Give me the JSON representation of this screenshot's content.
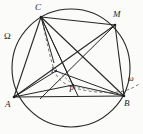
{
  "figure": {
    "canvas": {
      "width": 143,
      "height": 134,
      "background": "#fbfbfa"
    },
    "stroke_color": "#262626",
    "dash_color": "#5a5a5a"
  },
  "labels": [
    {
      "key": "omega_big",
      "text": "Ω",
      "x": 4,
      "y": 32,
      "size": "lbl-circ",
      "role": "circumcircle-name"
    },
    {
      "key": "omega_small",
      "text": "ω",
      "x": 128,
      "y": 75,
      "size": "lbl-small",
      "role": "second-circle-name"
    },
    {
      "key": "A",
      "text": "A",
      "x": 5,
      "y": 100,
      "size": "lbl-pt",
      "role": "vertex"
    },
    {
      "key": "B",
      "text": "B",
      "x": 124,
      "y": 99,
      "size": "lbl-pt",
      "role": "vertex"
    },
    {
      "key": "C",
      "text": "C",
      "x": 35,
      "y": 3,
      "size": "lbl-pt",
      "role": "vertex"
    },
    {
      "key": "M",
      "text": "M",
      "x": 113,
      "y": 10,
      "size": "lbl-pt",
      "role": "arc-midpoint"
    },
    {
      "key": "I",
      "text": "I",
      "x": 51,
      "y": 67,
      "size": "lbl-small",
      "role": "incenter"
    },
    {
      "key": "P",
      "text": "P",
      "x": 69,
      "y": 86,
      "size": "lbl-small",
      "role": "interior-point"
    }
  ],
  "points": {
    "A": {
      "x": 14,
      "y": 97
    },
    "B": {
      "x": 124,
      "y": 96
    },
    "C": {
      "x": 41,
      "y": 17
    },
    "M": {
      "x": 115,
      "y": 25
    },
    "I": {
      "x": 56,
      "y": 71
    },
    "P": {
      "x": 73,
      "y": 85
    },
    "T": {
      "x": 54,
      "y": 62
    }
  },
  "circles": [
    {
      "key": "Omega",
      "cx": 71,
      "cy": 68,
      "r": 59,
      "style": "solid",
      "name": "Ω"
    }
  ],
  "arcs": [
    {
      "key": "omega",
      "style": "dashed",
      "name": "ω",
      "path": "M 41 17 C 47 40 50 62 57 76 C 64 88 90 94 118 92 C 127 91 133 88 138 84"
    }
  ],
  "segments": [
    {
      "key": "AB",
      "from": "A",
      "to": "B",
      "style": "solid"
    },
    {
      "key": "AC",
      "from": "A",
      "to": "C",
      "style": "solid"
    },
    {
      "key": "CB",
      "from": "C",
      "to": "B",
      "style": "solid"
    },
    {
      "key": "AM",
      "from": "A",
      "to": "M",
      "style": "solid"
    },
    {
      "key": "CM",
      "from": "C",
      "to": "M",
      "style": "solid"
    },
    {
      "key": "MB",
      "from": "M",
      "to": "B",
      "style": "solid"
    },
    {
      "key": "AP",
      "from": "A",
      "to": "P",
      "style": "solid"
    },
    {
      "key": "PB",
      "from": "P",
      "to": "B",
      "style": "solid"
    },
    {
      "key": "CP",
      "from": "C",
      "to": "P",
      "style": "solid"
    },
    {
      "key": "CI_M_ext",
      "from": "C",
      "to": "M",
      "style": "solid"
    },
    {
      "key": "AI",
      "from": "A",
      "to": "I",
      "style": "solid"
    },
    {
      "key": "IB",
      "from": "I",
      "to": "B",
      "style": "solid"
    },
    {
      "key": "CT",
      "from": "C",
      "to": "T",
      "style": "solid"
    },
    {
      "key": "MI_ext",
      "from": "M",
      "to": "I",
      "style": "solid"
    },
    {
      "key": "IP",
      "from": "I",
      "to": "P",
      "style": "dashed"
    },
    {
      "key": "PB_dash",
      "from": "P",
      "to": "B",
      "style": "dashed"
    }
  ]
}
